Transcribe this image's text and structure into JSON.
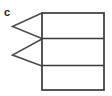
{
  "figure": {
    "label": "c",
    "stroke_color": "#4f4f4f",
    "stroke_color_dark": "#3a3a3a",
    "fill_color": "#ffffff",
    "background_color": "#ffffff",
    "stroke_width": 1.6,
    "width": 112,
    "height": 96
  },
  "rectangle": {
    "name": "stacked-bar-rectangle",
    "x": 42,
    "y": 13,
    "width": 62,
    "height": 77,
    "dividers": [
      38.5,
      65.5
    ]
  },
  "cells": [
    {
      "name": "cell-top",
      "y_top": 13,
      "y_bottom": 38.5
    },
    {
      "name": "cell-middle",
      "y_top": 38.5,
      "y_bottom": 65.5
    },
    {
      "name": "cell-bottom",
      "y_top": 65.5,
      "y_bottom": 90
    }
  ],
  "chevrons": [
    {
      "name": "chevron-upper",
      "points": "42,13 12.5,26.5 42,38.5"
    },
    {
      "name": "chevron-lower",
      "points": "42,39 12.5,55 42,66"
    }
  ]
}
